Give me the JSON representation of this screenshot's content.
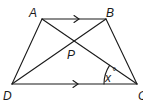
{
  "figure": {
    "type": "trapezium",
    "vertices": {
      "A": {
        "label": "A",
        "x": 42,
        "y": 19
      },
      "B": {
        "label": "B",
        "x": 106,
        "y": 19
      },
      "C": {
        "label": "C",
        "x": 137,
        "y": 84
      },
      "D": {
        "label": "D",
        "x": 12,
        "y": 84
      },
      "P": {
        "label": "P",
        "x": 73,
        "y": 42
      }
    },
    "angle_label": "x",
    "angle_unit": "°",
    "parallel_sides": [
      "AB",
      "DC"
    ],
    "colors": {
      "stroke": "#1a1a1a",
      "background": "#ffffff"
    }
  }
}
